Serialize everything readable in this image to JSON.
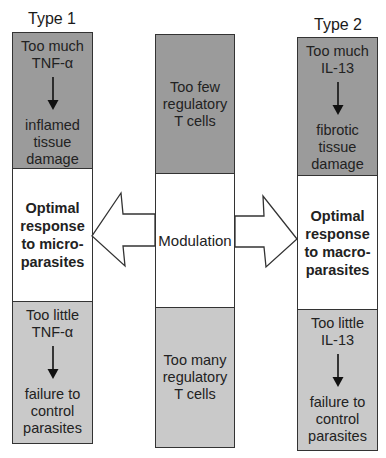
{
  "diagram": {
    "columns": [
      {
        "title": "Type 1",
        "top": {
          "lines": [
            "Too much",
            "TNF-α"
          ],
          "arrow": "down-arrow",
          "result_lines": [
            "inflamed",
            "tissue",
            "damage"
          ]
        },
        "middle": {
          "lines": [
            "Optimal",
            "response",
            "to micro-",
            "parasites"
          ]
        },
        "bottom": {
          "lines": [
            "Too little",
            "TNF-α"
          ],
          "arrow": "down-arrow",
          "result_lines": [
            "failure to",
            "control",
            "parasites"
          ]
        }
      },
      {
        "title": "",
        "top": {
          "lines": [
            "Too few",
            "regulatory",
            "T cells"
          ]
        },
        "middle": {
          "lines": [
            "Modulation"
          ]
        },
        "bottom": {
          "lines": [
            "Too many",
            "regulatory",
            "T cells"
          ]
        }
      },
      {
        "title": "Type 2",
        "top": {
          "lines": [
            "Too much",
            "IL-13"
          ],
          "arrow": "down-arrow",
          "result_lines": [
            "fibrotic",
            "tissue",
            "damage"
          ]
        },
        "middle": {
          "lines": [
            "Optimal",
            "response",
            "to macro-",
            "parasites"
          ]
        },
        "bottom": {
          "lines": [
            "Too little",
            "IL-13"
          ],
          "arrow": "down-arrow",
          "result_lines": [
            "failure to",
            "control",
            "parasites"
          ]
        }
      }
    ],
    "arrows": [
      {
        "name": "left-block-arrow",
        "direction": "left",
        "from": "Modulation",
        "to": "Type 1 optimal response"
      },
      {
        "name": "right-block-arrow",
        "direction": "right",
        "from": "Modulation",
        "to": "Type 2 optimal response"
      }
    ],
    "colors": {
      "dark_fill": "#9b9b9b",
      "light_fill": "#c9c9c9",
      "white_fill": "#ffffff",
      "border": "#333333"
    }
  }
}
